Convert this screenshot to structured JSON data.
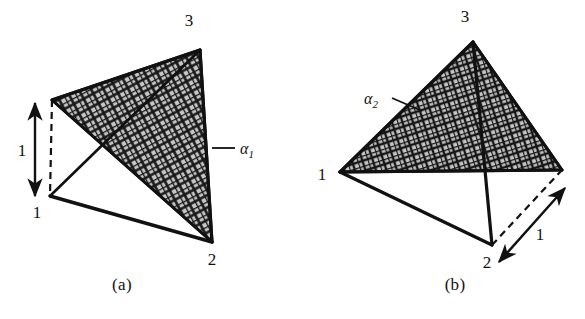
{
  "figure": {
    "type": "line-drawing",
    "background_color": "#ffffff",
    "ink_color": "#111111",
    "hatch_fill_color": "#b8b8b8",
    "panels": [
      {
        "id": "a",
        "caption": "(a)",
        "caption_pos": {
          "x": 122,
          "y": 290
        },
        "vertices": [
          {
            "id": "v1",
            "label": "1",
            "x": 50,
            "y": 196,
            "label_x": 37,
            "label_y": 218
          },
          {
            "id": "v2",
            "label": "2",
            "x": 212,
            "y": 242,
            "label_x": 212,
            "label_y": 265
          },
          {
            "id": "v3",
            "label": "3",
            "x": 200,
            "y": 50,
            "label_x": 189,
            "label_y": 26
          },
          {
            "id": "vtop",
            "label": "",
            "x": 52,
            "y": 100,
            "label_x": 0,
            "label_y": 0
          }
        ],
        "plane": {
          "name": "alpha-1",
          "label": "α",
          "subscript": "1",
          "label_x": 242,
          "label_y": 154,
          "leader": {
            "x1": 212,
            "y1": 148,
            "x2": 235,
            "y2": 148
          },
          "polygon": "52,100 200,50 212,242"
        },
        "dimension": {
          "label": "1",
          "label_x": 22,
          "label_y": 156,
          "arrow": {
            "x1": 35,
            "y1": 103,
            "x2": 35,
            "y2": 196
          },
          "dashed_guide": {
            "x1": 52,
            "y1": 100,
            "x2": 50,
            "y2": 196
          }
        },
        "solid_edges": [
          {
            "x1": 50,
            "y1": 196,
            "x2": 212,
            "y2": 242
          },
          {
            "x1": 50,
            "y1": 196,
            "x2": 200,
            "y2": 50
          },
          {
            "x1": 50,
            "y1": 196,
            "x2": 52,
            "y2": 100
          },
          {
            "x1": 200,
            "y1": 50,
            "x2": 212,
            "y2": 242
          },
          {
            "x1": 52,
            "y1": 100,
            "x2": 200,
            "y2": 50
          },
          {
            "x1": 52,
            "y1": 100,
            "x2": 212,
            "y2": 242
          }
        ]
      },
      {
        "id": "b",
        "caption": "(b)",
        "caption_pos": {
          "x": 455,
          "y": 290
        },
        "vertices": [
          {
            "id": "v1",
            "label": "1",
            "x": 340,
            "y": 172,
            "label_x": 322,
            "label_y": 180
          },
          {
            "id": "v2",
            "label": "2",
            "x": 492,
            "y": 245,
            "label_x": 487,
            "label_y": 268
          },
          {
            "id": "v3",
            "label": "3",
            "x": 473,
            "y": 42,
            "label_x": 465,
            "label_y": 22
          },
          {
            "id": "vright",
            "label": "",
            "x": 562,
            "y": 170,
            "label_x": 0,
            "label_y": 0
          }
        ],
        "plane": {
          "name": "alpha-2",
          "label": "α",
          "subscript": "2",
          "label_x": 370,
          "label_y": 104,
          "leader": {
            "x1": 392,
            "y1": 98,
            "x2": 420,
            "y2": 110
          },
          "polygon": "340,172 473,42 562,170"
        },
        "dimension": {
          "label": "1",
          "label_x": 538,
          "label_y": 238,
          "arrow": {
            "x1": 499,
            "y1": 262,
            "x2": 562,
            "y2": 190
          },
          "dashed_guide": {
            "x1": 492,
            "y1": 245,
            "x2": 562,
            "y2": 170
          }
        },
        "solid_edges": [
          {
            "x1": 340,
            "y1": 172,
            "x2": 492,
            "y2": 245
          },
          {
            "x1": 340,
            "y1": 172,
            "x2": 473,
            "y2": 42
          },
          {
            "x1": 473,
            "y1": 42,
            "x2": 492,
            "y2": 245
          },
          {
            "x1": 473,
            "y1": 42,
            "x2": 562,
            "y2": 170
          },
          {
            "x1": 340,
            "y1": 172,
            "x2": 562,
            "y2": 170
          }
        ]
      }
    ]
  }
}
